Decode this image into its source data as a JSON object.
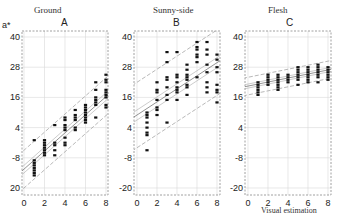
{
  "y_axis_label": "a*",
  "x_axis_label": "Visual estimation",
  "chart_data": [
    {
      "type": "scatter",
      "panel": "A",
      "title": "Ground",
      "xlabel": "",
      "ylabel": "a*",
      "xlim": [
        0,
        8
      ],
      "ylim": [
        -20,
        40
      ],
      "xticks": [
        0,
        2,
        4,
        6,
        8
      ],
      "yticks": [
        40,
        28,
        16,
        4,
        -8,
        -20
      ],
      "ytick_labels": [
        "40",
        "28",
        "16",
        "4",
        "-8",
        "20"
      ],
      "grid": true,
      "regression": {
        "slope": 3.6,
        "intercept": -12.5
      },
      "ci_inner_offset": 1.5,
      "pi_outer_offset": 7.5,
      "points": [
        [
          1,
          -1
        ],
        [
          1,
          -9
        ],
        [
          1,
          -10
        ],
        [
          1,
          -11
        ],
        [
          1,
          -12
        ],
        [
          1,
          -13
        ],
        [
          1,
          -14
        ],
        [
          1,
          -15
        ],
        [
          2,
          -1
        ],
        [
          2,
          -2
        ],
        [
          2,
          -3
        ],
        [
          2,
          -4
        ],
        [
          2,
          -5
        ],
        [
          2,
          -6
        ],
        [
          2,
          -7
        ],
        [
          3,
          5
        ],
        [
          3,
          -2
        ],
        [
          3,
          -3
        ],
        [
          3,
          -5
        ],
        [
          3,
          -7
        ],
        [
          4,
          8
        ],
        [
          4,
          7
        ],
        [
          4,
          5
        ],
        [
          4,
          4
        ],
        [
          4,
          3
        ],
        [
          4,
          0
        ],
        [
          4,
          -2
        ],
        [
          4,
          -3
        ],
        [
          5,
          11
        ],
        [
          5,
          9
        ],
        [
          5,
          8
        ],
        [
          5,
          7
        ],
        [
          5,
          4
        ],
        [
          5,
          3
        ],
        [
          6,
          13
        ],
        [
          6,
          12
        ],
        [
          6,
          11
        ],
        [
          6,
          10
        ],
        [
          6,
          9
        ],
        [
          6,
          8
        ],
        [
          6,
          7
        ],
        [
          6,
          6
        ],
        [
          7,
          22
        ],
        [
          7,
          19
        ],
        [
          7,
          16
        ],
        [
          7,
          15
        ],
        [
          7,
          14
        ],
        [
          7,
          13
        ],
        [
          7,
          8
        ],
        [
          8,
          25
        ],
        [
          8,
          23
        ],
        [
          8,
          22
        ],
        [
          8,
          19
        ],
        [
          8,
          18
        ],
        [
          8,
          17
        ],
        [
          8,
          16
        ],
        [
          8,
          13
        ],
        [
          8,
          12
        ]
      ]
    },
    {
      "type": "scatter",
      "panel": "B",
      "title": "Sunny-side",
      "xlabel": "",
      "ylabel": "",
      "xlim": [
        0,
        8
      ],
      "ylim": [
        -20,
        40
      ],
      "xticks": [
        0,
        2,
        4,
        6,
        8
      ],
      "yticks": [
        40,
        28,
        16,
        4,
        -8,
        -20
      ],
      "ytick_labels": [
        "40",
        "28",
        "16",
        "4",
        "-8",
        "-20"
      ],
      "grid": true,
      "regression": {
        "slope": 2.6,
        "intercept": 9
      },
      "ci_inner_offset": 2,
      "pi_outer_offset": 13,
      "points": [
        [
          1,
          10
        ],
        [
          1,
          9
        ],
        [
          1,
          8
        ],
        [
          1,
          6
        ],
        [
          1,
          4
        ],
        [
          1,
          2
        ],
        [
          1,
          1
        ],
        [
          1,
          -5
        ],
        [
          2,
          22
        ],
        [
          2,
          19
        ],
        [
          2,
          18
        ],
        [
          2,
          15
        ],
        [
          2,
          12
        ],
        [
          2,
          11
        ],
        [
          2,
          9
        ],
        [
          3,
          34
        ],
        [
          3,
          30
        ],
        [
          3,
          24
        ],
        [
          3,
          23
        ],
        [
          3,
          20
        ],
        [
          3,
          17
        ],
        [
          3,
          15
        ],
        [
          3,
          6
        ],
        [
          4,
          34
        ],
        [
          4,
          25
        ],
        [
          4,
          24
        ],
        [
          4,
          22
        ],
        [
          4,
          20
        ],
        [
          4,
          19
        ],
        [
          4,
          18
        ],
        [
          4,
          15
        ],
        [
          5,
          29
        ],
        [
          5,
          27
        ],
        [
          5,
          25
        ],
        [
          5,
          24
        ],
        [
          5,
          23
        ],
        [
          5,
          21
        ],
        [
          5,
          20
        ],
        [
          5,
          17
        ],
        [
          6,
          38
        ],
        [
          6,
          36
        ],
        [
          6,
          35
        ],
        [
          6,
          33
        ],
        [
          6,
          32
        ],
        [
          6,
          30
        ],
        [
          6,
          24
        ],
        [
          7,
          38
        ],
        [
          7,
          35
        ],
        [
          7,
          33
        ],
        [
          7,
          29
        ],
        [
          7,
          26
        ],
        [
          7,
          22
        ],
        [
          7,
          20
        ],
        [
          7,
          18
        ],
        [
          8,
          33
        ],
        [
          8,
          31
        ],
        [
          8,
          28
        ],
        [
          8,
          26
        ],
        [
          8,
          21
        ],
        [
          8,
          19
        ],
        [
          8,
          18
        ],
        [
          8,
          14
        ]
      ]
    },
    {
      "type": "scatter",
      "panel": "C",
      "title": "Flesh",
      "xlabel": "Visual estimation",
      "ylabel": "",
      "xlim": [
        0,
        8
      ],
      "ylim": [
        -20,
        40
      ],
      "xticks": [
        0,
        2,
        4,
        6,
        8
      ],
      "yticks": [
        40,
        28,
        16,
        4,
        -8,
        -20
      ],
      "ytick_labels": [
        "40",
        "28",
        "16",
        "4",
        "-8",
        "-20"
      ],
      "grid": true,
      "regression": {
        "slope": 0.8,
        "intercept": 20.5
      },
      "ci_inner_offset": 0.8,
      "pi_outer_offset": 3.5,
      "points": [
        [
          1,
          22
        ],
        [
          1,
          21
        ],
        [
          1,
          20
        ],
        [
          1,
          19
        ],
        [
          1,
          18
        ],
        [
          1,
          17
        ],
        [
          2,
          25
        ],
        [
          2,
          24
        ],
        [
          2,
          23
        ],
        [
          2,
          22
        ],
        [
          2,
          21
        ],
        [
          3,
          25
        ],
        [
          3,
          24
        ],
        [
          3,
          23
        ],
        [
          3,
          22
        ],
        [
          3,
          21
        ],
        [
          3,
          20
        ],
        [
          3,
          19
        ],
        [
          4,
          25
        ],
        [
          4,
          24
        ],
        [
          4,
          23
        ],
        [
          4,
          22
        ],
        [
          5,
          28
        ],
        [
          5,
          27
        ],
        [
          5,
          26
        ],
        [
          5,
          25
        ],
        [
          5,
          24
        ],
        [
          5,
          23
        ],
        [
          5,
          21
        ],
        [
          6,
          28
        ],
        [
          6,
          27
        ],
        [
          6,
          26
        ],
        [
          6,
          25
        ],
        [
          6,
          24
        ],
        [
          6,
          23
        ],
        [
          6,
          22
        ],
        [
          7,
          29
        ],
        [
          7,
          28
        ],
        [
          7,
          27
        ],
        [
          7,
          26
        ],
        [
          7,
          25
        ],
        [
          7,
          24
        ],
        [
          7,
          22
        ],
        [
          8,
          28
        ],
        [
          8,
          27
        ],
        [
          8,
          26
        ],
        [
          8,
          25
        ],
        [
          8,
          24
        ],
        [
          8,
          23
        ]
      ]
    }
  ],
  "panels": [
    {
      "title": "Ground",
      "letter": "A"
    },
    {
      "title": "Sunny-side",
      "letter": "B"
    },
    {
      "title": "Flesh",
      "letter": "C"
    }
  ]
}
